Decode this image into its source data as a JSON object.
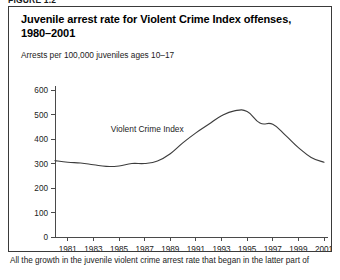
{
  "page": {
    "top_strip_text": "FIGURE 1.2",
    "caption": "All the growth in the juvenile violent crime arrest rate that began in the latter part of"
  },
  "chart_data": {
    "type": "line",
    "title": "Juvenile arrest rate for Violent Crime Index offenses, 1980–2001",
    "subtitle": "Arrests per 100,000 juveniles ages 10–17",
    "xlabel": "",
    "ylabel": "",
    "xlim": [
      1980,
      2001
    ],
    "ylim": [
      0,
      600
    ],
    "yticks": [
      0,
      100,
      200,
      300,
      400,
      500,
      600
    ],
    "ytick_labels": [
      "0",
      "100",
      "200",
      "300",
      "400",
      "500",
      "600"
    ],
    "xticks": [
      1981,
      1983,
      1985,
      1987,
      1989,
      1991,
      1993,
      1995,
      1997,
      1999,
      2001
    ],
    "xtick_labels": [
      "1981",
      "1983",
      "1985",
      "1987",
      "1989",
      "1991",
      "1993",
      "1995",
      "1997",
      "1999",
      "2001"
    ],
    "grid": false,
    "legend": "none",
    "annotations": [
      {
        "text": "Violent Crime Index",
        "x": 1987.2,
        "y": 430
      }
    ],
    "series": [
      {
        "name": "Violent Crime Index",
        "color": "#3d3d3d",
        "x": [
          1980,
          1981,
          1982,
          1983,
          1984,
          1985,
          1986,
          1987,
          1988,
          1989,
          1990,
          1991,
          1992,
          1993,
          1994,
          1995,
          1996,
          1997,
          1998,
          1999,
          2000,
          2001
        ],
        "values": [
          312,
          305,
          302,
          295,
          288,
          290,
          300,
          300,
          310,
          340,
          385,
          425,
          460,
          495,
          515,
          512,
          465,
          460,
          415,
          365,
          325,
          305
        ]
      }
    ]
  }
}
